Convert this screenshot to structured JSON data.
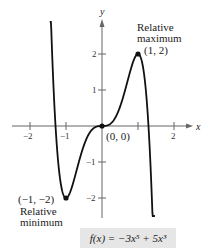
{
  "chart_data": {
    "type": "line",
    "title": "",
    "function": "f(x) = -3x^5 + 5x^3",
    "xlabel": "x",
    "ylabel": "y",
    "xlim": [
      -2.6,
      2.4
    ],
    "ylim": [
      -3.4,
      3.3
    ],
    "x_ticks": [
      -2,
      -1,
      1,
      2
    ],
    "x_tick_labels": [
      "−2",
      "−1",
      "",
      "2"
    ],
    "y_ticks": [
      -2,
      -1,
      1,
      2
    ],
    "y_tick_labels": [
      "−2",
      "−1",
      "1",
      "2"
    ],
    "grid": false,
    "points": [
      {
        "x": -1,
        "y": -2,
        "label": "(−1, −2)",
        "annotation": "Relative minimum"
      },
      {
        "x": 0,
        "y": 0,
        "label": "(0, 0)"
      },
      {
        "x": 1,
        "y": 2,
        "label": "(1, 2)",
        "annotation": "Relative maximum"
      }
    ],
    "series": [
      {
        "name": "f(x) = −3x⁵ + 5x³",
        "x": [
          -1.45,
          -1.3,
          -1.2,
          -1.1,
          -1.0,
          -0.8,
          -0.6,
          -0.4,
          -0.2,
          0,
          0.2,
          0.4,
          0.6,
          0.8,
          1.0,
          1.1,
          1.2,
          1.3,
          1.4,
          1.47
        ],
        "values": [
          2.64,
          0.15,
          -1.17,
          -1.86,
          -2.0,
          -1.58,
          -0.85,
          -0.29,
          -0.04,
          0,
          0.04,
          0.29,
          0.85,
          1.58,
          2.0,
          1.86,
          1.17,
          -0.15,
          -2.47,
          -3.8
        ]
      }
    ]
  },
  "labels": {
    "x_axis": "x",
    "y_axis": "y",
    "max_title_1": "Relative",
    "max_title_2": "maximum",
    "max_point": "(1,  2)",
    "min_point": "(−1, −2)",
    "min_title_1": "Relative",
    "min_title_2": "minimum",
    "origin_point": "(0,  0)",
    "equation": "f(x) = −3x⁵ + 5x³"
  }
}
